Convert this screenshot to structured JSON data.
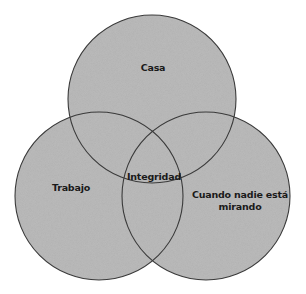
{
  "diagram": {
    "type": "venn",
    "background": "#ffffff",
    "fill_color": "#bcbcbc",
    "stroke_color": "#3a3a3a",
    "sets": [
      {
        "id": "casa",
        "label": "Casa",
        "cx": 152,
        "cy": 99,
        "r": 84
      },
      {
        "id": "trabajo",
        "label": "Trabajo",
        "cx": 99,
        "cy": 196,
        "r": 84
      },
      {
        "id": "cuando-nadie-esta-mirando",
        "label_line1": "Cuando nadie está",
        "label_line2": "mirando",
        "cx": 206,
        "cy": 196,
        "r": 84
      }
    ],
    "intersection": {
      "label": "Integridad"
    }
  }
}
